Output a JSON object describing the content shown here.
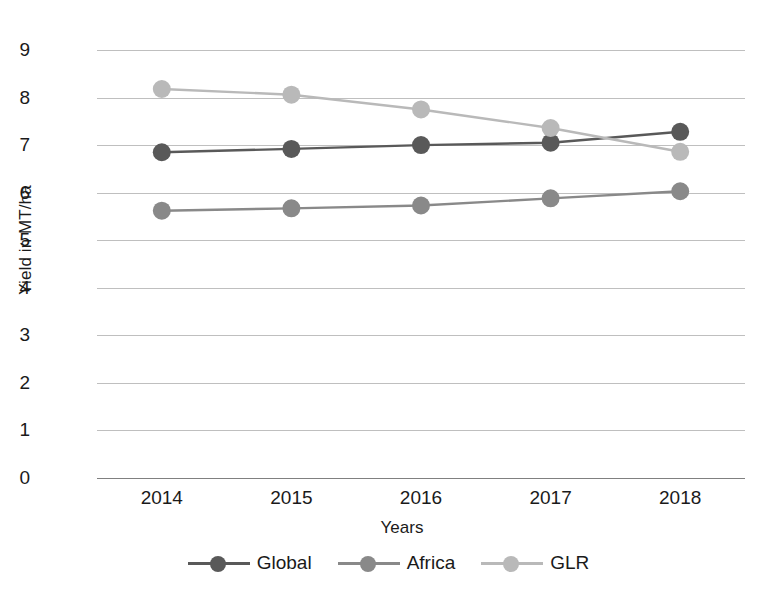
{
  "chart_data": {
    "type": "line",
    "title": "",
    "xlabel": "Years",
    "ylabel": "Yield in MT/ha",
    "categories": [
      "2014",
      "2015",
      "2016",
      "2017",
      "2018"
    ],
    "yticks": [
      0,
      1,
      2,
      3,
      4,
      5,
      6,
      7,
      8,
      9
    ],
    "ylim": [
      0,
      9
    ],
    "grid": true,
    "legend_position": "bottom",
    "series": [
      {
        "name": "Global",
        "color": "#595959",
        "values": [
          6.85,
          6.92,
          7.0,
          7.05,
          7.28
        ]
      },
      {
        "name": "Africa",
        "color": "#898989",
        "values": [
          5.62,
          5.67,
          5.73,
          5.88,
          6.03
        ]
      },
      {
        "name": "GLR",
        "color": "#b9b9b9",
        "values": [
          8.18,
          8.06,
          7.75,
          7.36,
          6.86
        ]
      }
    ]
  },
  "axes": {
    "y_title": "Yield in MT/ha",
    "x_title": "Years",
    "y_tick_labels": [
      "9",
      "8",
      "7",
      "6",
      "5",
      "4",
      "3",
      "2",
      "1",
      "0"
    ],
    "x_tick_labels": [
      "2014",
      "2015",
      "2016",
      "2017",
      "2018"
    ]
  },
  "legend": {
    "items": [
      {
        "label": "Global",
        "color": "#595959"
      },
      {
        "label": "Africa",
        "color": "#898989"
      },
      {
        "label": "GLR",
        "color": "#b9b9b9"
      }
    ]
  },
  "colors": {
    "gridline": "#bfbfbf",
    "baseline": "#808080",
    "text": "#1a1a1a",
    "background": "#ffffff"
  }
}
